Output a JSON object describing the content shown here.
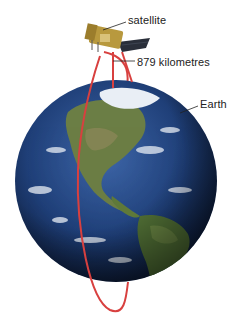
{
  "diagram": {
    "labels": {
      "satellite": "satellite",
      "altitude": "879 kilometres",
      "earth": "Earth"
    },
    "colors": {
      "orbit": "#d8403f",
      "ocean": "#1f3f78",
      "land": "#5f7a3a",
      "cloud": "#e9eef5",
      "leader_line": "#222222",
      "satellite_body": "#b8993e",
      "solar_panel": "#2a2f3a"
    }
  }
}
